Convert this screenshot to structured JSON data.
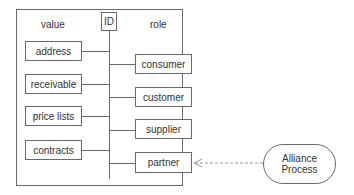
{
  "diagram": {
    "headers": {
      "value": "value",
      "id": "ID",
      "role": "role"
    },
    "value_items": [
      {
        "label": "address"
      },
      {
        "label": "receivable"
      },
      {
        "label": "price lists"
      },
      {
        "label": "contracts"
      }
    ],
    "role_items": [
      {
        "label": "consumer"
      },
      {
        "label": "customer"
      },
      {
        "label": "supplier"
      },
      {
        "label": "partner"
      }
    ],
    "external_process": {
      "line1": "Alliance",
      "line2": "Process"
    },
    "colors": {
      "stroke": "#6a6a6a",
      "dashed_arrow": "#9a9a9a",
      "background": "#ffffff"
    }
  }
}
